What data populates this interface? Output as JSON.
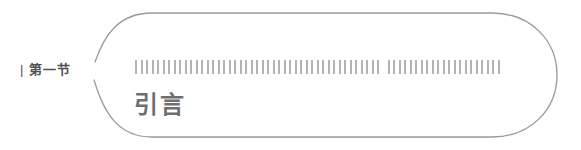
{
  "page": {
    "background_color": "#ffffff"
  },
  "section_label": {
    "accent_bar": "|",
    "text": "第一节",
    "color": "#4f4f4f"
  },
  "chapter_bubble": {
    "outline_color": "#9a9a9a",
    "redacted_line": {
      "tick_groups": [
        45,
        21
      ],
      "tick_color": "#b3b3b3"
    },
    "title": {
      "text": "引言",
      "color": "#6f6f6f"
    }
  }
}
